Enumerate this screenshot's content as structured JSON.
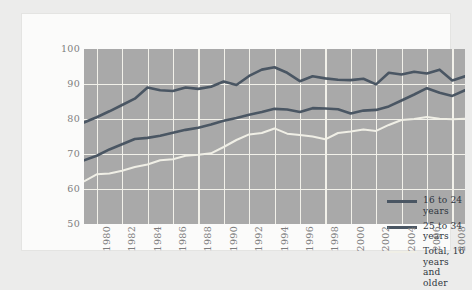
{
  "chart_data": {
    "type": "line",
    "title": "",
    "xlabel": "",
    "ylabel": "",
    "ylim": [
      50,
      100
    ],
    "yticks": [
      50,
      60,
      70,
      80,
      90,
      100
    ],
    "xlim": [
      1979,
      2009
    ],
    "xticks": [
      1980,
      1982,
      1984,
      1986,
      1988,
      1990,
      1992,
      1994,
      1996,
      1998,
      2000,
      2002,
      2004,
      2006,
      2008
    ],
    "xtick_labels": [
      "1980",
      "1982",
      "1984",
      "1986",
      "1988",
      "1990",
      "1992",
      "1994",
      "1996",
      "1998",
      "2000",
      "2002",
      "2004",
      "2006",
      "2008"
    ],
    "grid": true,
    "legend_position": "lower right",
    "plot_background": "#a9a9a9",
    "grid_color": "#f2f1ea",
    "x": [
      1979,
      1980,
      1981,
      1982,
      1983,
      1984,
      1985,
      1986,
      1987,
      1988,
      1989,
      1990,
      1991,
      1992,
      1993,
      1994,
      1995,
      1996,
      1997,
      1998,
      1999,
      2000,
      2001,
      2002,
      2003,
      2004,
      2005,
      2006,
      2007,
      2008,
      2009
    ],
    "series": [
      {
        "name": "16 to 24 years",
        "color": "#4a5663",
        "width": 2.6,
        "values": [
          79.0,
          80.5,
          82.2,
          84.0,
          85.8,
          89.0,
          88.2,
          88.0,
          89.0,
          88.6,
          89.2,
          90.7,
          89.7,
          92.3,
          94.1,
          94.8,
          93.2,
          90.8,
          92.2,
          91.6,
          91.2,
          91.1,
          91.5,
          89.9,
          93.2,
          92.7,
          93.5,
          93.0,
          94.1,
          91.0,
          92.2
        ]
      },
      {
        "name": "25 to 34 years",
        "color": "#4a5663",
        "width": 2.6,
        "values": [
          68.2,
          69.5,
          71.3,
          72.8,
          74.3,
          74.6,
          75.2,
          76.1,
          76.9,
          77.5,
          78.4,
          79.5,
          80.3,
          81.2,
          82.0,
          82.9,
          82.7,
          82.0,
          83.1,
          83.0,
          82.8,
          81.6,
          82.4,
          82.6,
          83.6,
          85.3,
          87.0,
          88.8,
          87.5,
          86.6,
          88.2
        ]
      },
      {
        "name": "Total, 16 years\nand older",
        "color": "#f0efe6",
        "width": 2.0,
        "values": [
          62.2,
          64.2,
          64.4,
          65.2,
          66.3,
          67.0,
          68.2,
          68.5,
          69.5,
          69.8,
          70.2,
          72.0,
          74.0,
          75.6,
          76.0,
          77.3,
          75.8,
          75.4,
          75.0,
          74.2,
          76.0,
          76.4,
          77.0,
          76.6,
          78.3,
          79.7,
          80.0,
          80.6,
          80.1,
          79.9,
          80.1
        ]
      }
    ]
  },
  "legend": {
    "items": [
      {
        "label": "16 to 24 years",
        "color": "#4a5663",
        "thickness": "3px"
      },
      {
        "label": "25 to 34 years",
        "color": "#4a5663",
        "thickness": "3px"
      },
      {
        "label": "Total, 16 years\nand older",
        "color": "#f0efe6",
        "thickness": "2px"
      }
    ]
  }
}
